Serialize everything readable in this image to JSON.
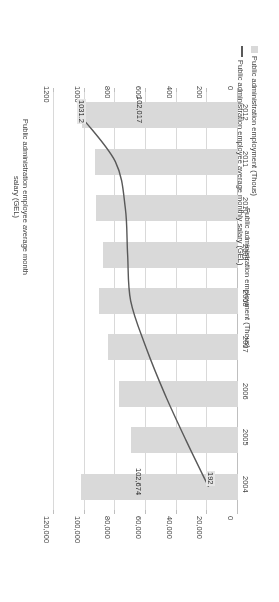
{
  "chart_data": {
    "type": "bar",
    "title": "",
    "categories": [
      "2004",
      "2005",
      "2006",
      "2007",
      "2008",
      "2009",
      "2010",
      "2011",
      "2012"
    ],
    "series": [
      {
        "name": "Public administration employment (Thous)",
        "type": "bar",
        "axis": "primary",
        "values": [
          102674,
          69700,
          77400,
          84800,
          90900,
          88300,
          92800,
          93500,
          102017
        ],
        "color": "#d9d9d9"
      },
      {
        "name": "Public administration employee average monthly salary (GEL)",
        "type": "line",
        "axis": "secondary",
        "values": [
          192,
          339,
          478,
          600,
          700,
          720,
          735,
          800,
          1031.2
        ],
        "color": "#595959"
      }
    ],
    "xlabel": "Public administration employment (Thous)",
    "ylabel": "Public administration employee average monthly salary (GEL)",
    "primary_axis": {
      "label": "Public administration employment (Thous)",
      "ticks": [
        "0",
        "20,000",
        "40,000",
        "60,000",
        "80,000",
        "100,000",
        "120,000"
      ],
      "tick_values": [
        0,
        20000,
        40000,
        60000,
        80000,
        100000,
        120000
      ],
      "min": 0,
      "max": 120000
    },
    "secondary_axis": {
      "label": "Public administration employee average monthly salary (GEL)",
      "label_line1": "Public administration employee average month",
      "label_line2": "salary (GEL)",
      "ticks": [
        "0",
        "200",
        "400",
        "600",
        "800",
        "1000",
        "1200"
      ],
      "tick_values": [
        0,
        200,
        400,
        600,
        800,
        1000,
        1200
      ],
      "min": 0,
      "max": 1200
    },
    "data_labels": [
      {
        "category": "2004",
        "series": "bar",
        "text": "102,674"
      },
      {
        "category": "2004",
        "series": "line",
        "text": "192"
      },
      {
        "category": "2012",
        "series": "bar",
        "text": "102,017"
      },
      {
        "category": "2012",
        "series": "line",
        "text": "1031.2"
      }
    ],
    "grid": true,
    "legend_position": "bottom"
  },
  "legend": {
    "bar_label": "Public administration employment (Thous)",
    "line_label": "Public administration employee average monthly salary (GEL)"
  },
  "colors": {
    "bar": "#d9d9d9",
    "line": "#595959",
    "grid": "#d9d9d9",
    "axis": "#bfbfbf",
    "text": "#404040",
    "label_bg": "#e6e6e6",
    "background": "#ffffff"
  }
}
